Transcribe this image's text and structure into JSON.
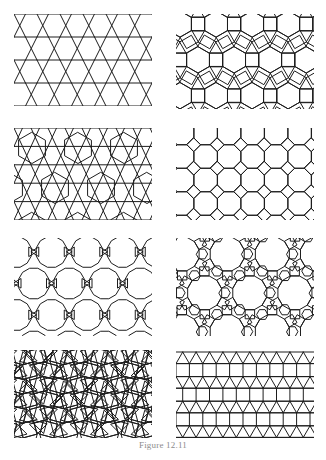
{
  "figure": {
    "caption_title": "Figure",
    "caption_number": "12.11",
    "caption_full": "Figure 12.11",
    "page_background": "#ffffff",
    "stroke_color": "#1d1d1d",
    "caption_color": "#8b8b8b",
    "panel_count": 8,
    "columns": 2,
    "rows": 4
  },
  "panels": [
    {
      "index": 1,
      "position": "row-1-left",
      "name": "trihexagonal-triangle-hexagon-tiling",
      "description": "Bands of horizontal lines crossed by zigzag lines forming triangles and hexagons",
      "vertex_figure": "3.6.3.6",
      "shapes": [
        "triangle",
        "hexagon"
      ],
      "x": 14,
      "y": 14,
      "width": 138,
      "height": 92
    },
    {
      "index": 2,
      "position": "row-1-right",
      "name": "rhombitrihexagonal-tiling",
      "description": "Hexagons, squares and triangles arranged around each vertex",
      "vertex_figure": "3.4.6.4",
      "shapes": [
        "triangle",
        "square",
        "hexagon"
      ],
      "x": 176,
      "y": 14,
      "width": 138,
      "height": 95
    },
    {
      "index": 3,
      "position": "row-2-left",
      "name": "hexagon-triangle-band-tiling",
      "description": "Large hexagons separated by bands of triangles",
      "vertex_figure": "3.3.3.3.6",
      "shapes": [
        "triangle",
        "hexagon"
      ],
      "x": 14,
      "y": 128,
      "width": 138,
      "height": 92
    },
    {
      "index": 4,
      "position": "row-2-right",
      "name": "truncated-square-tiling",
      "description": "Octagons with small squares in the interstices",
      "vertex_figure": "4.8.8",
      "shapes": [
        "square",
        "octagon"
      ],
      "x": 176,
      "y": 128,
      "width": 138,
      "height": 92
    },
    {
      "index": 5,
      "position": "row-3-left",
      "name": "dodecagon-triangle-tiling",
      "description": "Large twelve-sided polygons in offset rows with small triangles in the gaps",
      "vertex_figure": "3.12.12",
      "shapes": [
        "triangle",
        "dodecagon"
      ],
      "x": 14,
      "y": 238,
      "width": 138,
      "height": 98
    },
    {
      "index": 6,
      "position": "row-3-right",
      "name": "dodecagon-square-hexagon-tiling",
      "description": "Large dodecagons ringed by squares and small hexagons",
      "vertex_figure": "4.6.12",
      "shapes": [
        "square",
        "hexagon",
        "dodecagon"
      ],
      "x": 176,
      "y": 238,
      "width": 138,
      "height": 98
    },
    {
      "index": 7,
      "position": "row-4-left",
      "name": "snub-square-pinwheel-tiling",
      "description": "Tilted squares surrounded by triangles in a pinwheel arrangement",
      "vertex_figure": "3.3.4.3.4",
      "shapes": [
        "triangle",
        "square"
      ],
      "x": 14,
      "y": 350,
      "width": 138,
      "height": 88
    },
    {
      "index": 8,
      "position": "row-4-right",
      "name": "elongated-triangular-tiling",
      "description": "Alternating horizontal rows of squares and rows of triangles",
      "vertex_figure": "3.3.3.4.4",
      "shapes": [
        "triangle",
        "square"
      ],
      "x": 176,
      "y": 350,
      "width": 138,
      "height": 88
    }
  ]
}
